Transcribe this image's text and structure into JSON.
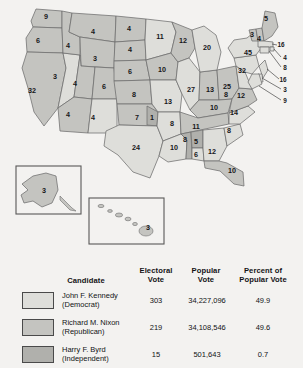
{
  "map": {
    "states": [
      {
        "name": "Washington",
        "abbr": "WA",
        "votes": "9",
        "x": 46,
        "y": 17,
        "winner": "nixon"
      },
      {
        "name": "Oregon",
        "abbr": "OR",
        "votes": "6",
        "x": 38,
        "y": 41,
        "winner": "nixon"
      },
      {
        "name": "California",
        "abbr": "CA",
        "votes": "32",
        "x": 32,
        "y": 91,
        "winner": "nixon"
      },
      {
        "name": "Nevada",
        "abbr": "NV",
        "votes": "3",
        "x": 55,
        "y": 77,
        "winner": "kennedy"
      },
      {
        "name": "Idaho",
        "abbr": "ID",
        "votes": "4",
        "x": 68,
        "y": 46,
        "winner": "nixon"
      },
      {
        "name": "Montana",
        "abbr": "MT",
        "votes": "4",
        "x": 93,
        "y": 32,
        "winner": "nixon"
      },
      {
        "name": "Wyoming",
        "abbr": "WY",
        "votes": "3",
        "x": 95,
        "y": 59,
        "winner": "nixon"
      },
      {
        "name": "Utah",
        "abbr": "UT",
        "votes": "4",
        "x": 75,
        "y": 84,
        "winner": "nixon"
      },
      {
        "name": "Arizona",
        "abbr": "AZ",
        "votes": "4",
        "x": 68,
        "y": 115,
        "winner": "nixon"
      },
      {
        "name": "New Mexico",
        "abbr": "NM",
        "votes": "4",
        "x": 93,
        "y": 118,
        "winner": "kennedy"
      },
      {
        "name": "Colorado",
        "abbr": "CO",
        "votes": "6",
        "x": 104,
        "y": 87,
        "winner": "nixon"
      },
      {
        "name": "North Dakota",
        "abbr": "ND",
        "votes": "4",
        "x": 129,
        "y": 29,
        "winner": "nixon"
      },
      {
        "name": "South Dakota",
        "abbr": "SD",
        "votes": "4",
        "x": 130,
        "y": 50,
        "winner": "nixon"
      },
      {
        "name": "Nebraska",
        "abbr": "NE",
        "votes": "6",
        "x": 130,
        "y": 72,
        "winner": "nixon"
      },
      {
        "name": "Kansas",
        "abbr": "KS",
        "votes": "8",
        "x": 134,
        "y": 95,
        "winner": "nixon"
      },
      {
        "name": "Oklahoma",
        "abbr": "OK",
        "votes": "7",
        "x": 137,
        "y": 118,
        "winner": "nixon"
      },
      {
        "name": "Oklahoma-byrd",
        "abbr": "OK2",
        "votes": "1",
        "x": 152,
        "y": 118,
        "winner": "byrd"
      },
      {
        "name": "Texas",
        "abbr": "TX",
        "votes": "24",
        "x": 136,
        "y": 148,
        "winner": "kennedy"
      },
      {
        "name": "Minnesota",
        "abbr": "MN",
        "votes": "11",
        "x": 160,
        "y": 37,
        "winner": "kennedy"
      },
      {
        "name": "Iowa",
        "abbr": "IA",
        "votes": "10",
        "x": 162,
        "y": 70,
        "winner": "nixon"
      },
      {
        "name": "Missouri",
        "abbr": "MO",
        "votes": "13",
        "x": 168,
        "y": 102,
        "winner": "kennedy"
      },
      {
        "name": "Arkansas",
        "abbr": "AR",
        "votes": "8",
        "x": 172,
        "y": 124,
        "winner": "kennedy"
      },
      {
        "name": "Louisiana",
        "abbr": "LA",
        "votes": "10",
        "x": 174,
        "y": 148,
        "winner": "kennedy"
      },
      {
        "name": "Wisconsin",
        "abbr": "WI",
        "votes": "12",
        "x": 183,
        "y": 41,
        "winner": "nixon"
      },
      {
        "name": "Illinois",
        "abbr": "IL",
        "votes": "27",
        "x": 191,
        "y": 90,
        "winner": "kennedy"
      },
      {
        "name": "Indiana",
        "abbr": "IN",
        "votes": "13",
        "x": 210,
        "y": 90,
        "winner": "nixon"
      },
      {
        "name": "Michigan",
        "abbr": "MI",
        "votes": "20",
        "x": 207,
        "y": 48,
        "winner": "kennedy"
      },
      {
        "name": "Ohio",
        "abbr": "OH",
        "votes": "25",
        "x": 227,
        "y": 87,
        "winner": "nixon"
      },
      {
        "name": "Kentucky",
        "abbr": "KY",
        "votes": "10",
        "x": 214,
        "y": 108,
        "winner": "nixon"
      },
      {
        "name": "Tennessee",
        "abbr": "TN",
        "votes": "11",
        "x": 196,
        "y": 127,
        "winner": "nixon"
      },
      {
        "name": "Mississippi",
        "abbr": "MS",
        "votes": "8",
        "x": 185,
        "y": 140,
        "winner": "byrd"
      },
      {
        "name": "Alabama",
        "abbr": "AL",
        "votes": "5",
        "x": 196,
        "y": 142,
        "winner": "byrd"
      },
      {
        "name": "Alabama-kennedy",
        "abbr": "AL2",
        "votes": "6",
        "x": 196,
        "y": 155,
        "winner": "kennedy"
      },
      {
        "name": "Georgia",
        "abbr": "GA",
        "votes": "12",
        "x": 212,
        "y": 152,
        "winner": "kennedy"
      },
      {
        "name": "Florida",
        "abbr": "FL",
        "votes": "10",
        "x": 232,
        "y": 171,
        "winner": "nixon"
      },
      {
        "name": "South Carolina",
        "abbr": "SC",
        "votes": "8",
        "x": 229,
        "y": 131,
        "winner": "kennedy"
      },
      {
        "name": "North Carolina",
        "abbr": "NC",
        "votes": "14",
        "x": 234,
        "y": 113,
        "winner": "kennedy"
      },
      {
        "name": "Virginia",
        "abbr": "VA",
        "votes": "12",
        "x": 241,
        "y": 96,
        "winner": "nixon"
      },
      {
        "name": "West Virginia",
        "abbr": "WV",
        "votes": "8",
        "x": 226,
        "y": 95,
        "winner": "kennedy"
      },
      {
        "name": "Pennsylvania",
        "abbr": "PA",
        "votes": "32",
        "x": 242,
        "y": 71,
        "winner": "kennedy"
      },
      {
        "name": "New York",
        "abbr": "NY",
        "votes": "45",
        "x": 248,
        "y": 53,
        "winner": "kennedy"
      },
      {
        "name": "Vermont",
        "abbr": "VT",
        "votes": "3",
        "x": 252,
        "y": 35,
        "winner": "nixon"
      },
      {
        "name": "New Hampshire",
        "abbr": "NH",
        "votes": "4",
        "x": 259,
        "y": 39,
        "winner": "nixon"
      },
      {
        "name": "Maine",
        "abbr": "ME",
        "votes": "5",
        "x": 266,
        "y": 19,
        "winner": "nixon"
      }
    ],
    "callouts": [
      {
        "name": "Massachusetts",
        "abbr": "MA",
        "votes": "16",
        "x": 281,
        "y": 45
      },
      {
        "name": "Rhode Island",
        "abbr": "RI",
        "votes": "4",
        "x": 285,
        "y": 58
      },
      {
        "name": "Connecticut",
        "abbr": "CT",
        "votes": "8",
        "x": 285,
        "y": 68
      },
      {
        "name": "New Jersey",
        "abbr": "NJ",
        "votes": "16",
        "x": 283,
        "y": 80
      },
      {
        "name": "Delaware",
        "abbr": "DE",
        "votes": "3",
        "x": 285,
        "y": 90
      },
      {
        "name": "Maryland",
        "abbr": "MD",
        "votes": "9",
        "x": 285,
        "y": 101
      }
    ],
    "insets": [
      {
        "name": "Alaska",
        "abbr": "AK",
        "votes": "3",
        "label_x": 44,
        "label_y": 191
      },
      {
        "name": "Hawaii",
        "abbr": "HI",
        "votes": "3",
        "label_x": 148,
        "label_y": 228
      }
    ]
  },
  "legend": {
    "headers": {
      "candidate": "Candidate",
      "electoral_vote": "Electoral\nVote",
      "electoral_vote_l1": "Electoral",
      "electoral_vote_l2": "Vote",
      "popular_vote_l1": "Popular",
      "popular_vote_l2": "Vote",
      "percent_l1": "Percent of",
      "percent_l2": "Popular Vote"
    },
    "rows": [
      {
        "candidate": "John F. Kennedy",
        "party": "(Democrat)",
        "electoral_vote": "303",
        "popular_vote": "34,227,096",
        "percent_popular_vote": "49.9",
        "color": "#dededa"
      },
      {
        "candidate": "Richard M. Nixon",
        "party": "(Republican)",
        "electoral_vote": "219",
        "popular_vote": "34,108,546",
        "percent_popular_vote": "49.6",
        "color": "#c4c4c0"
      },
      {
        "candidate": "Harry F. Byrd",
        "party": "(Independent)",
        "electoral_vote": "15",
        "popular_vote": "501,643",
        "percent_popular_vote": "0.7",
        "color": "#b0b0ac"
      }
    ]
  },
  "colors": {
    "kennedy": "#dededa",
    "nixon": "#c4c4c0",
    "byrd": "#b0b0ac",
    "background": "#f3f2f0",
    "stroke": "#6d6d6d"
  }
}
